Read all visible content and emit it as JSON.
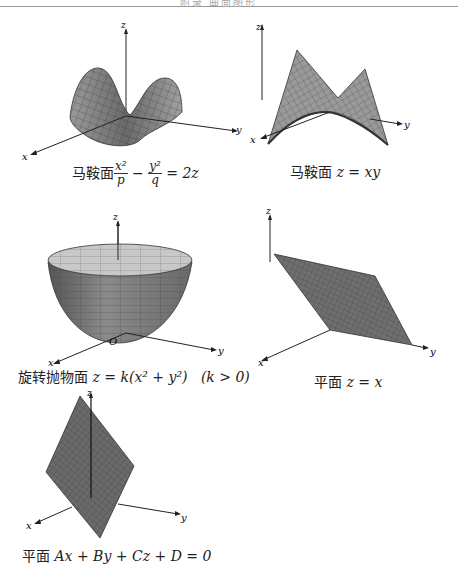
{
  "header": {
    "text": "附录 曲面图形"
  },
  "figures": [
    {
      "id": "saddle-1",
      "name_cn": "马鞍面",
      "equation": "x²/p − y²/q = 2z",
      "eq_parts": {
        "num1": "x²",
        "den1": "p",
        "minus": "−",
        "num2": "y²",
        "den2": "q",
        "rhs": "= 2z"
      },
      "axes": {
        "x": "x",
        "y": "y",
        "z": "z"
      }
    },
    {
      "id": "saddle-2",
      "name_cn": "马鞍面",
      "equation": "z = xy",
      "axes": {
        "x": "x",
        "y": "y",
        "z": "z"
      }
    },
    {
      "id": "paraboloid",
      "name_cn": "旋转抛物面",
      "equation": "z = k(x² + y²)",
      "condition": "(k > 0)",
      "axes": {
        "x": "x",
        "y": "y",
        "z": "z",
        "origin": "O"
      }
    },
    {
      "id": "plane-1",
      "name_cn": "平面",
      "equation": "z = x",
      "axes": {
        "x": "x",
        "y": "y",
        "z": "z"
      }
    },
    {
      "id": "plane-2",
      "name_cn": "平面",
      "equation": "Ax + By + Cz + D = 0",
      "axes": {
        "x": "x",
        "y": "y",
        "z": "z"
      }
    }
  ],
  "colors": {
    "surface": "#8a8a8a",
    "surface_dark": "#5a5a5a",
    "mesh": "#333333",
    "axis": "#222222"
  }
}
